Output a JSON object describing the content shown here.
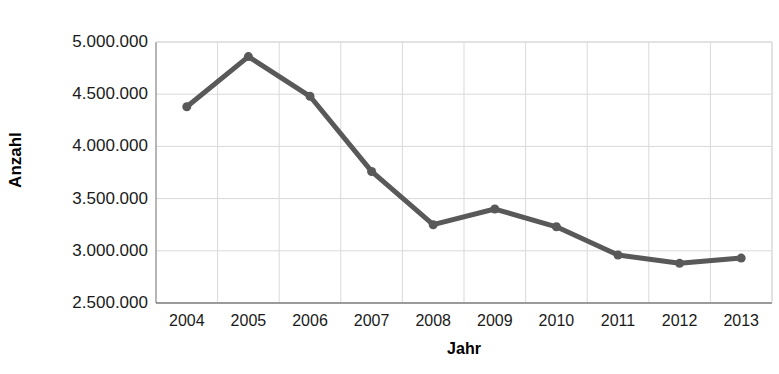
{
  "chart_data": {
    "type": "line",
    "title": "",
    "xlabel": "Jahr",
    "ylabel": "Anzahl",
    "categories": [
      "2004",
      "2005",
      "2006",
      "2007",
      "2008",
      "2009",
      "2010",
      "2011",
      "2012",
      "2013"
    ],
    "values": [
      4380000,
      4860000,
      4480000,
      3760000,
      3250000,
      3400000,
      3230000,
      2960000,
      2880000,
      2930000
    ],
    "series": [
      {
        "name": "Anzahl",
        "values": [
          4380000,
          4860000,
          4480000,
          3760000,
          3250000,
          3400000,
          3230000,
          2960000,
          2880000,
          2930000
        ],
        "color": "#595959"
      }
    ],
    "ylim": [
      2500000,
      5000000
    ],
    "ytick_step": 500000,
    "ytick_labels": [
      "5.000.000",
      "4.500.000",
      "4.000.000",
      "3.500.000",
      "3.000.000",
      "2.500.000"
    ],
    "ytick_values": [
      5000000,
      4500000,
      4000000,
      3500000,
      3000000,
      2500000
    ],
    "grid": {
      "horizontal": true,
      "vertical": true,
      "color": "#d9d9d9"
    },
    "legend": {
      "visible": false,
      "position": "none"
    },
    "marker": {
      "shape": "circle",
      "size": 9,
      "color": "#595959"
    },
    "line": {
      "width": 5,
      "color": "#595959"
    },
    "axis_line_color": "#808080",
    "background": "#ffffff"
  }
}
